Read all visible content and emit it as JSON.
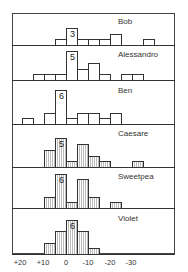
{
  "chart_data": {
    "type": "bar",
    "subtype": "stacked-panel histogram",
    "title": "",
    "xlabel": "",
    "ylabel": "",
    "x_ticks": [
      "+20",
      "+10",
      "0",
      "-10",
      "-20",
      "-30"
    ],
    "bin_width": 5,
    "bin_edges": [
      20,
      15,
      10,
      5,
      0,
      -5,
      -10,
      -15,
      -20,
      -25,
      -30,
      -35,
      -40
    ],
    "bin_labels": [
      "+20 to +15",
      "+15 to +10",
      "+10 to +5",
      "+5 to 0",
      "0 to -5",
      "-5 to -10",
      "-10 to -15",
      "-15 to -20",
      "-20 to -25",
      "-25 to -30",
      "-30 to -35",
      "-35 to -40"
    ],
    "grid": false,
    "legend": null,
    "series": [
      {
        "name": "Bob",
        "peak_label": "3",
        "hatched": false,
        "values": [
          0,
          0,
          0,
          1,
          3,
          1,
          1,
          1,
          2,
          0,
          0,
          1
        ]
      },
      {
        "name": "Alessandro",
        "peak_label": "5",
        "hatched": false,
        "values": [
          0,
          1,
          1,
          1,
          5,
          2,
          3,
          1,
          0,
          1,
          1,
          0
        ]
      },
      {
        "name": "Ben",
        "peak_label": "6",
        "hatched": false,
        "values": [
          1,
          0,
          2,
          6,
          1,
          2,
          2,
          1,
          2,
          0,
          0,
          0
        ]
      },
      {
        "name": "Caesare",
        "peak_label": "5",
        "hatched": true,
        "values": [
          0,
          0,
          3,
          5,
          1,
          4,
          2,
          1,
          0,
          0,
          1,
          0
        ]
      },
      {
        "name": "Sweetpea",
        "peak_label": "6",
        "hatched": true,
        "values": [
          0,
          0,
          2,
          6,
          1,
          5,
          2,
          0,
          1,
          0,
          0,
          0
        ]
      },
      {
        "name": "Violet",
        "peak_label": "6",
        "hatched": true,
        "values": [
          0,
          0,
          2,
          4,
          6,
          4,
          1,
          0,
          0,
          0,
          0,
          0
        ]
      }
    ]
  },
  "panels": [
    {
      "label": "Bob"
    },
    {
      "label": "Alessandro"
    },
    {
      "label": "Ben"
    },
    {
      "label": "Caesare"
    },
    {
      "label": "Sweetpea"
    },
    {
      "label": "Violet"
    }
  ],
  "axis": {
    "ticks": [
      {
        "label": "+20",
        "x": 20
      },
      {
        "label": "+10",
        "x": 43
      },
      {
        "label": "0",
        "x": 66
      },
      {
        "label": "-10",
        "x": 88
      },
      {
        "label": "-20",
        "x": 110
      },
      {
        "label": "-30",
        "x": 131
      }
    ]
  },
  "colors": {
    "line": "#333333",
    "hatch": "#bbbbbb",
    "background": "#ffffff"
  }
}
